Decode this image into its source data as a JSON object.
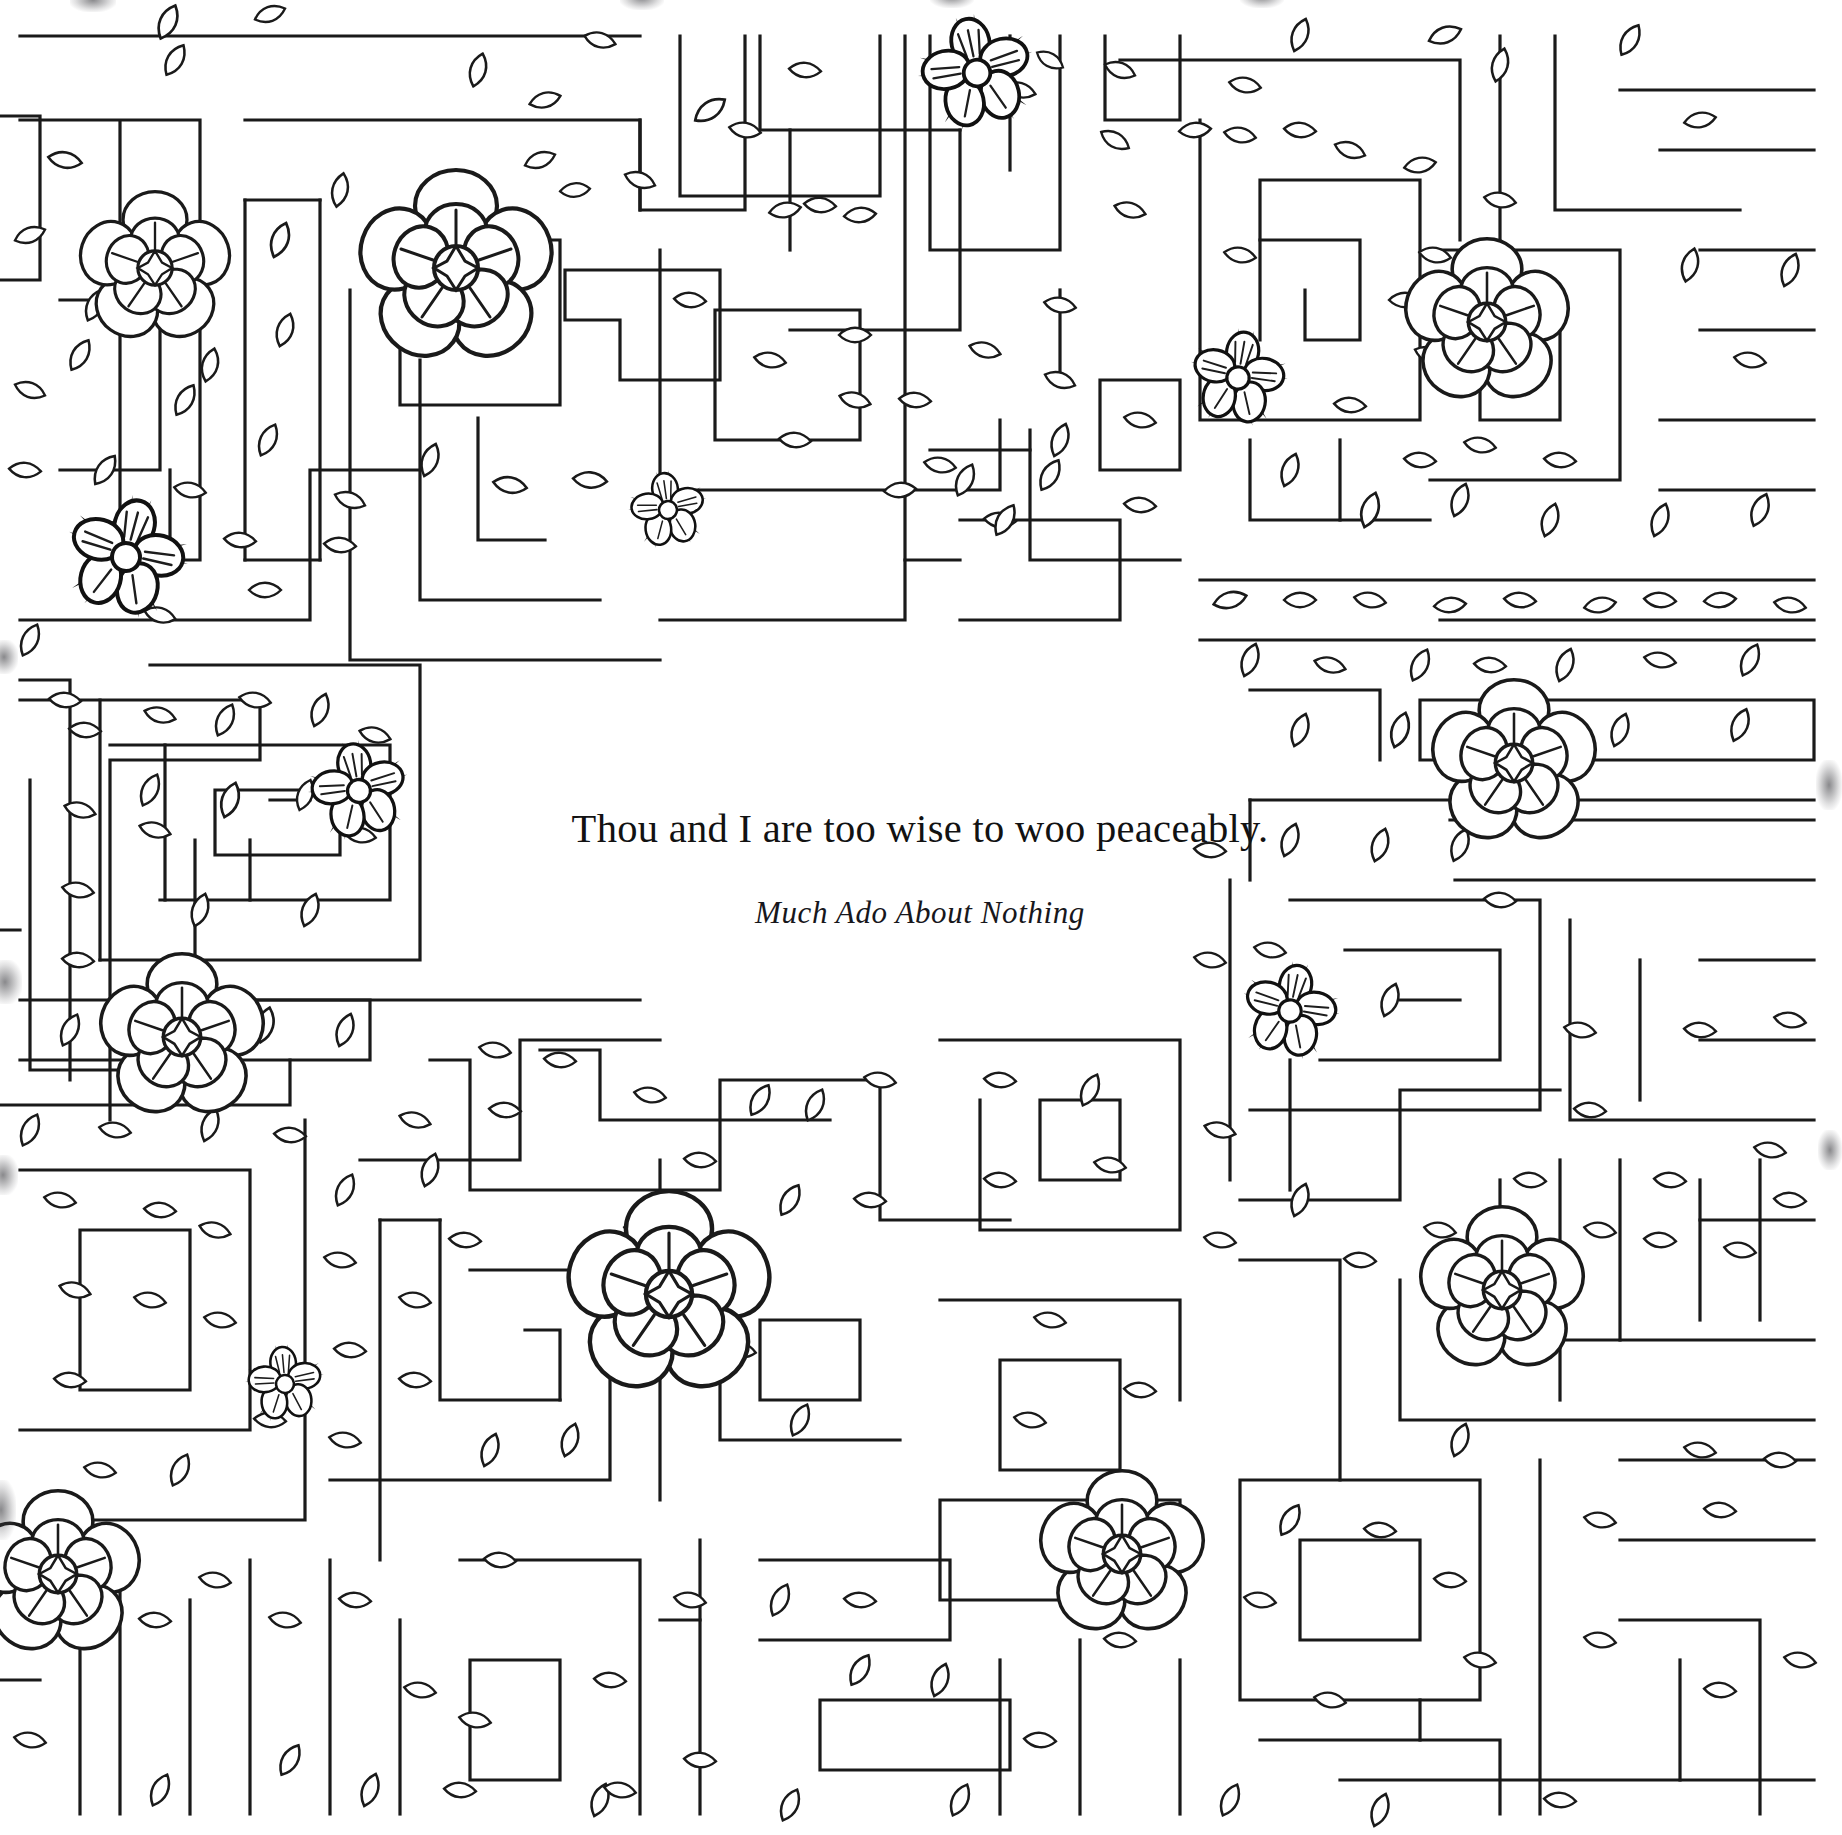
{
  "page": {
    "kind": "coloring-book-page",
    "background_color": "#ffffff",
    "ink_color": "#1a1a1a",
    "width": 1834,
    "height": 1835
  },
  "quote": {
    "text": "Thou and I are too wise to woo peaceably.",
    "source": "Much Ado About Nothing"
  },
  "artwork": {
    "description": "Aerial-view hedge maze border drawn in black line art with scattered leaf shapes, large camellia blossoms and small spiky five-petal flowers; the centre of the page is left blank for the quotation.",
    "line_color": "#1a1a1a",
    "line_width": 3,
    "motifs": [
      {
        "name": "hedge-wall",
        "count": 0,
        "shape": "double-line rectangular corridor"
      },
      {
        "name": "leaf",
        "count": 0,
        "shape": "pointed ellipse"
      },
      {
        "name": "camellia-flower",
        "count": 9,
        "shape": "five rounded outer petals with inner ring and radiating centre"
      },
      {
        "name": "spiky-flower",
        "count": 7,
        "shape": "five rounded petals with black spiky sepals and circular centre"
      }
    ],
    "camellias": [
      {
        "id": "camellia-top-left",
        "cx": 155,
        "cy": 268,
        "r": 57
      },
      {
        "id": "camellia-top-left-2",
        "cx": 456,
        "cy": 268,
        "r": 72
      },
      {
        "id": "camellia-top-right",
        "cx": 1487,
        "cy": 322,
        "r": 62
      },
      {
        "id": "camellia-mid-right",
        "cx": 1514,
        "cy": 763,
        "r": 62
      },
      {
        "id": "camellia-mid-left",
        "cx": 182,
        "cy": 1037,
        "r": 62
      },
      {
        "id": "camellia-bottom-centre",
        "cx": 669,
        "cy": 1294,
        "r": 76
      },
      {
        "id": "camellia-bottom-right",
        "cx": 1502,
        "cy": 1290,
        "r": 62
      },
      {
        "id": "camellia-bottom-left",
        "cx": 58,
        "cy": 1574,
        "r": 62
      },
      {
        "id": "camellia-bottom-mid",
        "cx": 1122,
        "cy": 1554,
        "r": 62
      }
    ],
    "spiky_flowers": [
      {
        "id": "spiky-top",
        "cx": 977,
        "cy": 73,
        "r": 40
      },
      {
        "id": "spiky-upper-right",
        "cx": 1238,
        "cy": 378,
        "r": 34
      },
      {
        "id": "spiky-centre-top",
        "cx": 668,
        "cy": 510,
        "r": 27
      },
      {
        "id": "spiky-left",
        "cx": 126,
        "cy": 557,
        "r": 42
      },
      {
        "id": "spiky-mid-left",
        "cx": 359,
        "cy": 791,
        "r": 34
      },
      {
        "id": "spiky-mid-right",
        "cx": 1290,
        "cy": 1011,
        "r": 34
      },
      {
        "id": "spiky-bottom-left",
        "cx": 285,
        "cy": 1384,
        "r": 27
      }
    ]
  }
}
